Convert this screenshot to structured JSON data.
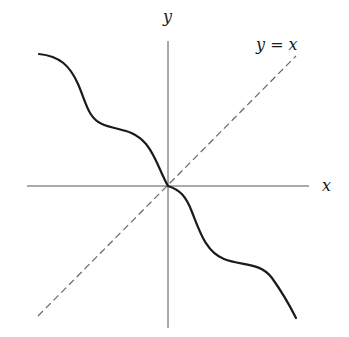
{
  "diagram": {
    "axes": {
      "x_label": "x",
      "y_label": "y",
      "origin": [
        168,
        186
      ],
      "x_axis_extent": [
        27,
        309
      ],
      "y_axis_extent": [
        41,
        328
      ],
      "color": "#555555"
    },
    "reference_line": {
      "label": "y = x",
      "style": "dashed",
      "color": "#666666",
      "from": [
        38,
        316
      ],
      "to": [
        296,
        56
      ]
    },
    "curve": {
      "style": "solid",
      "color": "#1a1a1a",
      "description": "Decreasing staircase-like curve with inflection plateaus in quadrant II and IV, passing through origin"
    }
  }
}
